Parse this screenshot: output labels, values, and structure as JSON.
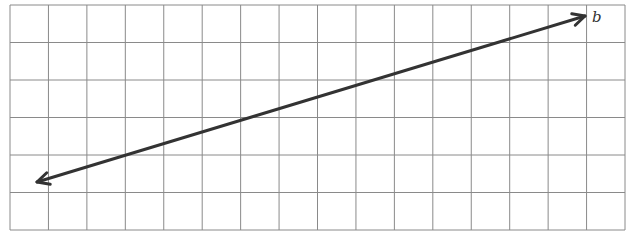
{
  "diagram": {
    "type": "grid-with-line",
    "grid": {
      "columns": 16,
      "rows": 6,
      "left": 10,
      "top": 5,
      "right": 625,
      "bottom": 230,
      "line_color": "#8a8a8a"
    },
    "line": {
      "name": "b",
      "label": "b",
      "start": {
        "x": 37,
        "y": 182
      },
      "end": {
        "x": 585,
        "y": 16
      },
      "color": "#333333",
      "arrows": "both"
    },
    "label_position": {
      "x": 592,
      "y": 8
    }
  }
}
